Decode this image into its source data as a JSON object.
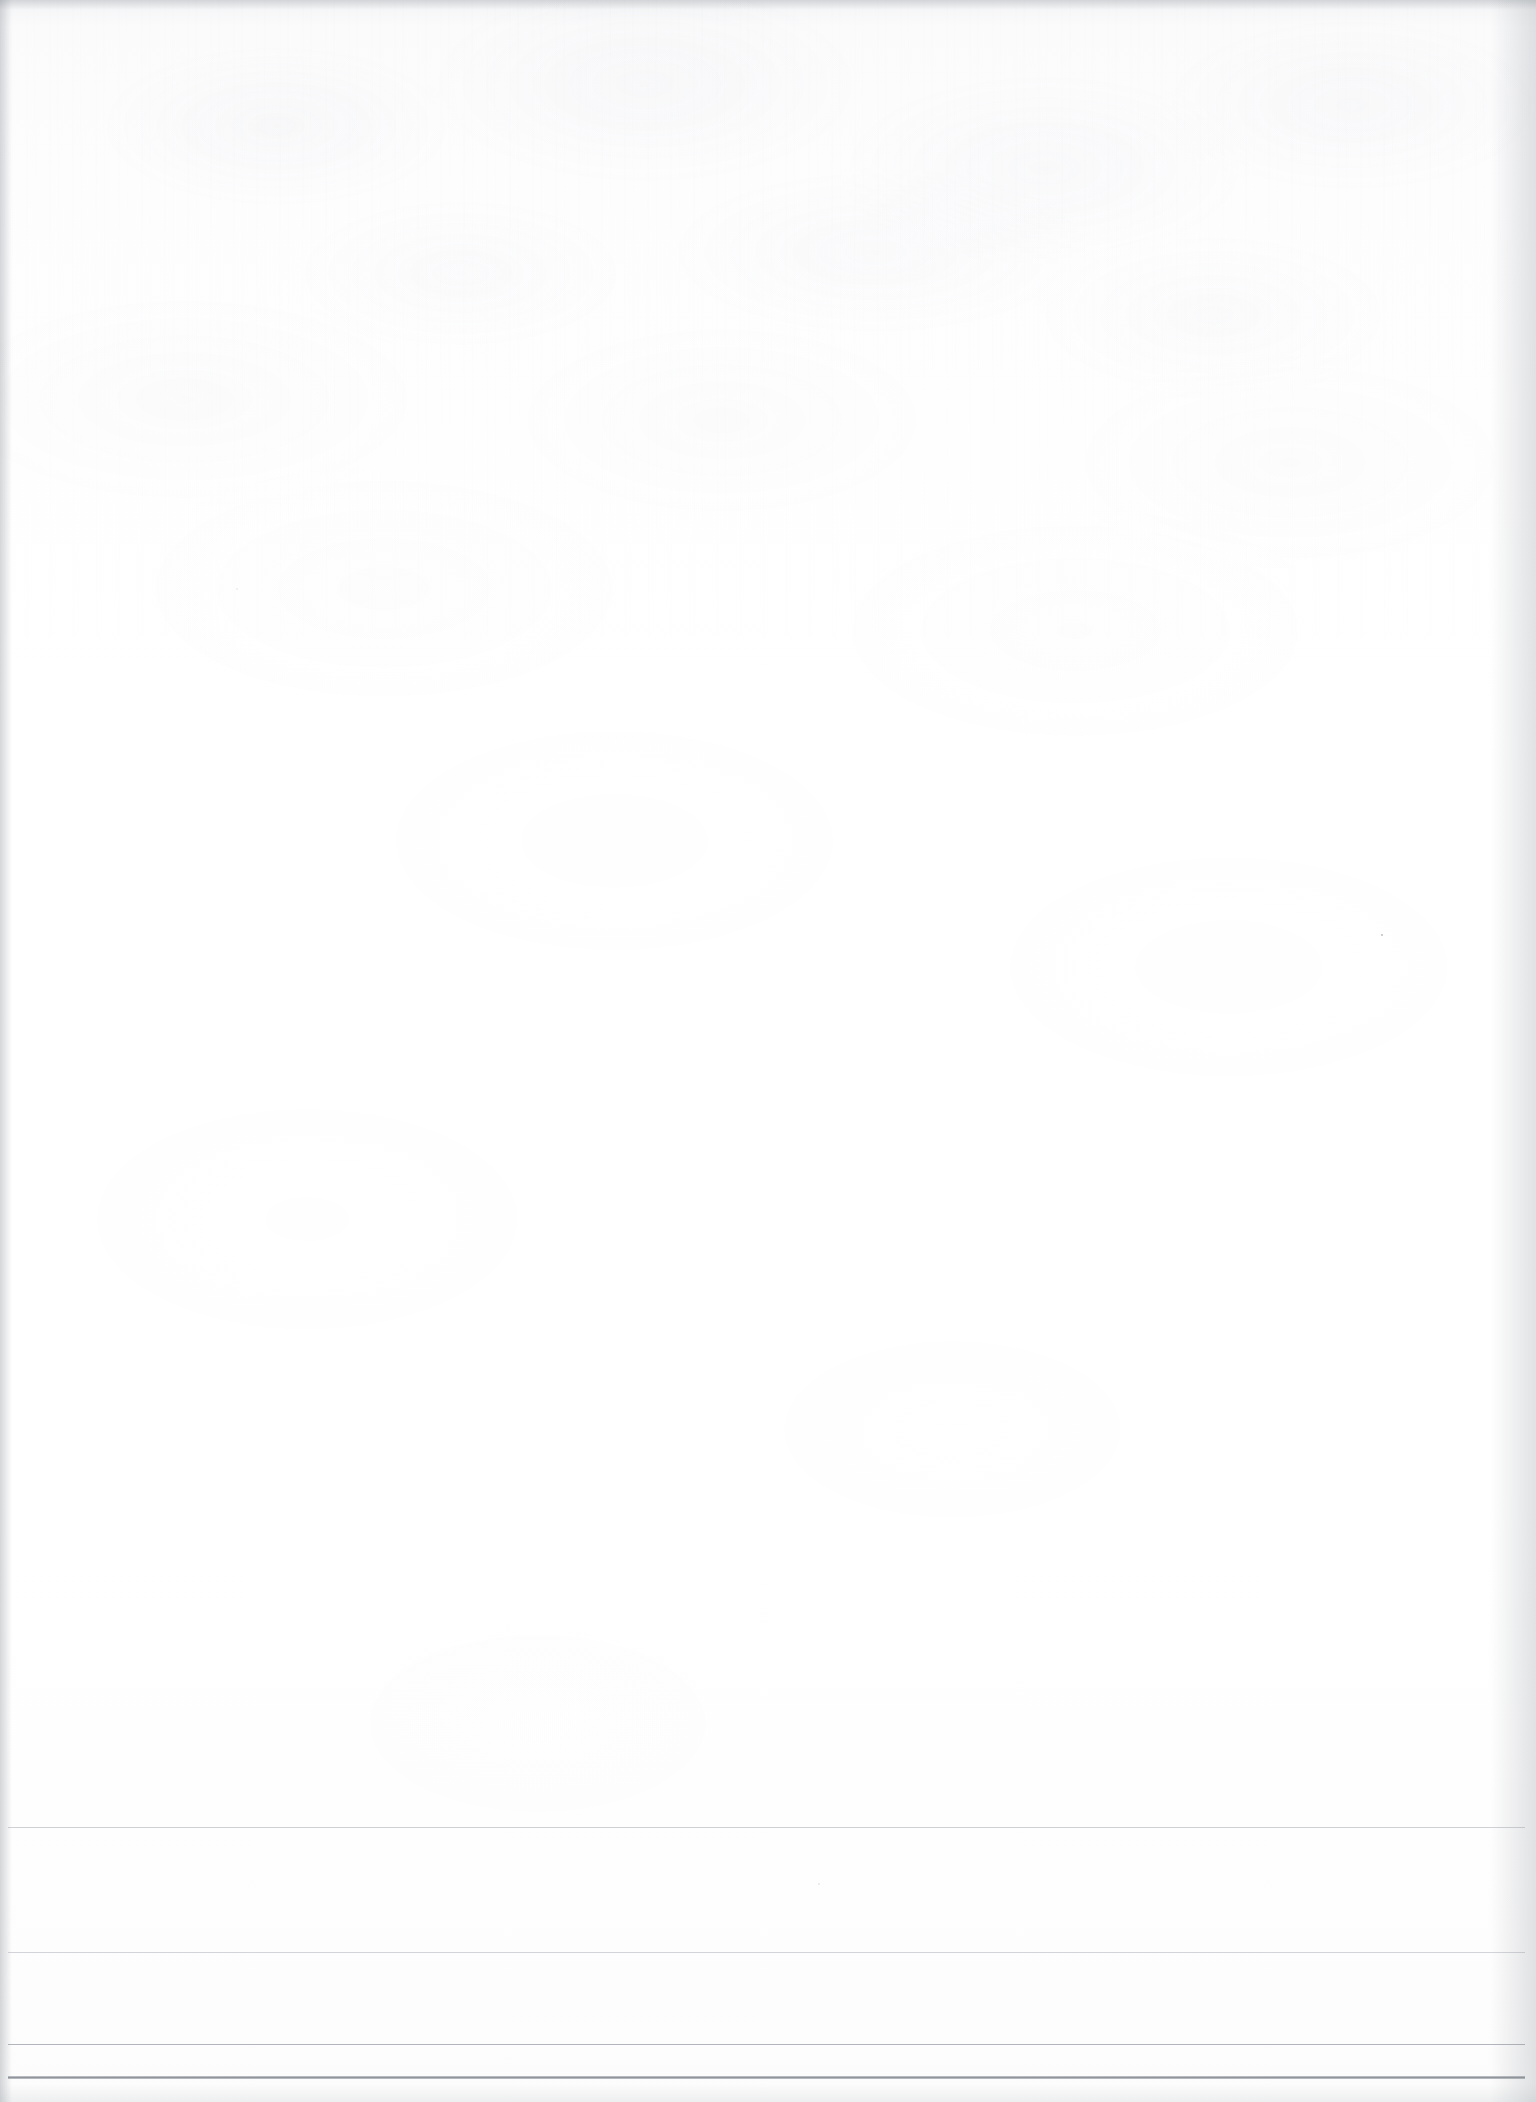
{
  "document": {
    "kind": "scanned-page",
    "title": "Blank scanned document page",
    "page_width": 1536,
    "page_height": 2102,
    "background_color": "#ffffff",
    "paper_tint": "#fdfdfe",
    "body_text": "",
    "has_visible_text": false,
    "orientation": "portrait"
  },
  "texture": {
    "label": "paper-grain",
    "description": "Faint mottled scanner grain, heaviest across the upper third of the sheet",
    "noise_color": "#969ba2",
    "streak_color": "#969ba2"
  },
  "edges": {
    "top_shadow_color": "#878c94",
    "left_shadow_color": "#828894",
    "right_shadow_color": "#8a8f96",
    "bottom_shadow_color": "#969ba2"
  },
  "ruled_lines": [
    {
      "name": "rule-1",
      "y": 1827,
      "thickness": 1,
      "color": "#969ca6",
      "weight": "light"
    },
    {
      "name": "rule-2",
      "y": 1952,
      "thickness": 1,
      "color": "#969ca6",
      "weight": "light"
    },
    {
      "name": "rule-3",
      "y": 2044,
      "thickness": 1,
      "color": "#848a94",
      "weight": "medium"
    },
    {
      "name": "rule-4",
      "y": 2076,
      "thickness": 3,
      "color": "#8a8f96",
      "weight": "heavy"
    }
  ],
  "specks": [
    {
      "name": "speck-upper-right",
      "x": 1381,
      "y": 934,
      "size": 2
    },
    {
      "name": "speck-lower-center",
      "x": 818,
      "y": 1883,
      "size": 2
    },
    {
      "name": "speck-mid-left",
      "x": 236,
      "y": 588,
      "size": 2
    }
  ]
}
